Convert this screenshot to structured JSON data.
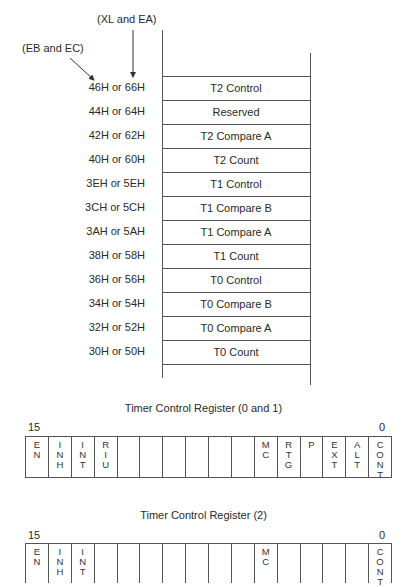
{
  "memory_map": {
    "label_xl_ea": "(XL and EA)",
    "label_eb_ec": "(EB and EC)",
    "rows": [
      {
        "address": "46H or 66H",
        "name": "T2 Control"
      },
      {
        "address": "44H or 64H",
        "name": "Reserved"
      },
      {
        "address": "42H or 62H",
        "name": "T2 Compare A"
      },
      {
        "address": "40H or 60H",
        "name": "T2 Count"
      },
      {
        "address": "3EH or 5EH",
        "name": "T1 Control"
      },
      {
        "address": "3CH or 5CH",
        "name": "T1 Compare B"
      },
      {
        "address": "3AH or 5AH",
        "name": "T1 Compare A"
      },
      {
        "address": "38H or 58H",
        "name": "T1 Count"
      },
      {
        "address": "36H or 56H",
        "name": "T0 Control"
      },
      {
        "address": "34H or 54H",
        "name": "T0 Compare B"
      },
      {
        "address": "32H or 52H",
        "name": "T0 Compare A"
      },
      {
        "address": "30H or 50H",
        "name": "T0 Count"
      }
    ]
  },
  "registers": [
    {
      "title": "Timer Control Register (0 and 1)",
      "msb": "15",
      "lsb": "0",
      "bits": [
        "EN",
        "INH",
        "INT",
        "RIU",
        "",
        "",
        "",
        "",
        "",
        "",
        "MC",
        "RTG",
        "P",
        "EXT",
        "ALT",
        "CONT"
      ]
    },
    {
      "title": "Timer Control Register (2)",
      "msb": "15",
      "lsb": "0",
      "bits": [
        "EN",
        "INH",
        "INT",
        "",
        "",
        "",
        "",
        "",
        "",
        "",
        "MC",
        "",
        "",
        "",
        "",
        "CONT"
      ]
    }
  ]
}
